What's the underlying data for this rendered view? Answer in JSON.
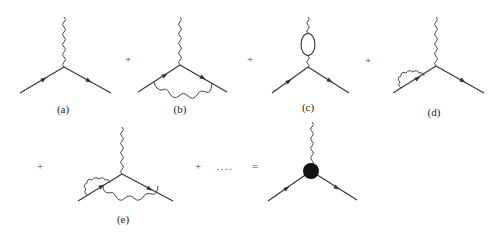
{
  "diagram": {
    "labels": {
      "a": "(a)",
      "b": "(b)",
      "c": "(c)",
      "d": "(d)",
      "e": "(e)"
    },
    "operators": {
      "plus": "+",
      "ellipsis": "....",
      "equals": "="
    },
    "colors": {
      "line": "#333333",
      "blob": "#111111",
      "background": "#ffffff"
    },
    "items": [
      {
        "id": "a",
        "kind": "tree-level vertex"
      },
      {
        "id": "b",
        "kind": "vertex correction (internal photon exchange)"
      },
      {
        "id": "c",
        "kind": "vacuum polarization loop on photon line"
      },
      {
        "id": "d",
        "kind": "fermion self-energy on incoming leg"
      },
      {
        "id": "e",
        "kind": "self-energy plus vertex correction"
      },
      {
        "id": "full",
        "kind": "full dressed vertex (black blob)"
      }
    ]
  }
}
